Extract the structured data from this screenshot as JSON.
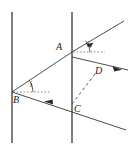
{
  "figure": {
    "stroke_color": "#3a3a3a",
    "label_color": "#1a1a1a",
    "background": "#ffffff",
    "width": 130,
    "height": 153
  },
  "labels": {
    "point_a": "A",
    "point_b": "B",
    "point_c": "C",
    "point_d": "D",
    "angle_at_a": "i",
    "angle_at_b": "i"
  },
  "elements": {
    "surface_left": "left-boundary-line",
    "surface_right": "right-boundary-line",
    "incident_ray_a": "incident-ray-into-A",
    "ray_a_to_b": "ray-A-to-B",
    "ray_b_to_c": "ray-B-to-C",
    "emergent_ray_d": "emergent-ray-through-D",
    "dashed_c_to_d": "dashed-line-C-to-D",
    "normal_dashes_a": "dotted-normal-at-A",
    "normal_dashes_b": "dotted-normal-at-B"
  },
  "geometry": {
    "left_line": {
      "x": 12,
      "y1": 12,
      "y2": 143
    },
    "right_line": {
      "x": 72,
      "y1": 12,
      "y2": 143
    },
    "point_a": {
      "x": 72,
      "y": 52
    },
    "point_b": {
      "x": 12,
      "y": 92
    },
    "point_c": {
      "x": 72,
      "y": 104
    },
    "point_d": {
      "x": 94,
      "y": 78
    }
  }
}
